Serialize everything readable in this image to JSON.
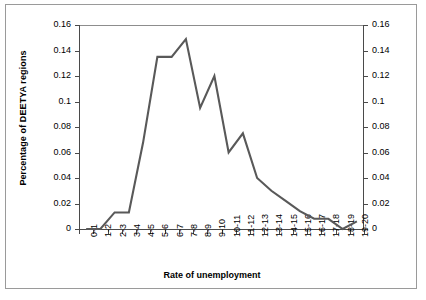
{
  "chart_data": {
    "type": "line",
    "title": "",
    "xlabel": "Rate of unemployment",
    "ylabel": "Percentage of DEETYA regions",
    "ylabel_right": "",
    "categories": [
      "0-1",
      "1-2",
      "2-3",
      "3-4",
      "4-5",
      "5-6",
      "6-7",
      "7-8",
      "8-9",
      "9-10",
      "10-11",
      "11-12",
      "12-13",
      "13-14",
      "14-15",
      "15-16",
      "16-17",
      "17-18",
      "18-19",
      "19-20"
    ],
    "values": [
      0,
      0,
      0.013,
      0.013,
      0.068,
      0.135,
      0.135,
      0.149,
      0.095,
      0.12,
      0.06,
      0.075,
      0.04,
      0.03,
      0.022,
      0.014,
      0.008,
      0.008,
      0,
      0.006
    ],
    "ylim": [
      0,
      0.16
    ],
    "ytick_values": [
      0,
      0.02,
      0.04,
      0.06,
      0.08,
      0.1,
      0.12,
      0.14,
      0.16
    ],
    "ytick_labels": [
      "0",
      "0.02",
      "0.04",
      "0.06",
      "0.08",
      "0.1",
      "0.12",
      "0.14",
      "0.16"
    ],
    "ytick_labels_right": [
      "0",
      "0.02",
      "0.04",
      "0.06",
      "0.08",
      "0.1",
      "0.12",
      "0.14",
      "0.16"
    ],
    "grid": false,
    "legend": false,
    "series_color": "#595959",
    "axis_color": "#4a4a4a",
    "border_color": "#9a9a9a",
    "background": "#ffffff"
  }
}
